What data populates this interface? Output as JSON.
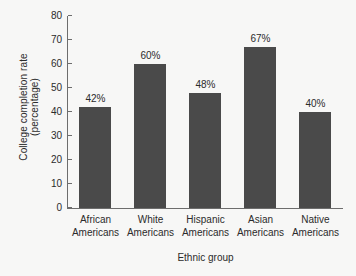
{
  "chart_data": {
    "type": "bar",
    "title": "",
    "xlabel": "Ethnic group",
    "ylabel_line1": "College completion rate",
    "ylabel_line2": "(percentage)",
    "categories": [
      {
        "line1": "African",
        "line2": "Americans"
      },
      {
        "line1": "White",
        "line2": "Americans"
      },
      {
        "line1": "Hispanic",
        "line2": "Americans"
      },
      {
        "line1": "Asian",
        "line2": "Americans"
      },
      {
        "line1": "Native",
        "line2": "Americans"
      }
    ],
    "values": [
      42,
      60,
      48,
      67,
      40
    ],
    "value_labels": [
      "42%",
      "60%",
      "48%",
      "67%",
      "40%"
    ],
    "ylim": [
      0,
      80
    ],
    "yticks": [
      0,
      10,
      20,
      30,
      40,
      50,
      60,
      70,
      80
    ],
    "ytick_labels": [
      "0",
      "10",
      "20",
      "30",
      "40",
      "50",
      "60",
      "70",
      "80"
    ],
    "grid": false,
    "legend": null,
    "bar_color": "#4a4a4a",
    "axis_color": "#6d6d6d",
    "background_color": "#f7f7f6"
  }
}
